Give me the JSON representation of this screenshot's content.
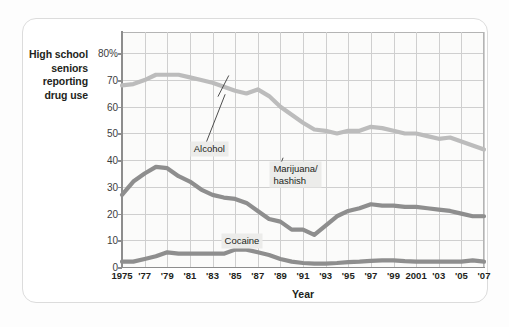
{
  "figure": {
    "y_axis_caption": "High school\nseniors\nreporting\ndrug use",
    "x_axis_title": "Year"
  },
  "annotations": [
    {
      "name": "alcohol",
      "text": "Alcohol",
      "x_pct": 19.0,
      "y_pct": 53.0
    },
    {
      "name": "marijuana",
      "text": "Marijuana/\nhashish",
      "x_pct": 41.0,
      "y_pct": 44.5
    },
    {
      "name": "cocaine",
      "text": "Cocaine",
      "x_pct": 27.5,
      "y_pct": 14.0
    }
  ],
  "chart_data": {
    "type": "line",
    "title": "",
    "subtitle": "",
    "xlabel": "Year",
    "ylabel": "High school seniors reporting drug use",
    "xlim": [
      1975,
      2007
    ],
    "ylim": [
      0,
      88
    ],
    "grid": true,
    "legend_position": "inline-annotations",
    "ytick_labels": [
      "0",
      "10",
      "20",
      "30",
      "40",
      "50",
      "60",
      "70",
      "80%"
    ],
    "ytick_values": [
      0,
      10,
      20,
      30,
      40,
      50,
      60,
      70,
      80
    ],
    "xtick_labels": [
      "1975",
      "'77",
      "'79",
      "'81",
      "'83",
      "'85",
      "'87",
      "'89",
      "'91",
      "'93",
      "'95",
      "'97",
      "'99",
      "2001",
      "'03",
      "'05",
      "'07"
    ],
    "xtick_values": [
      1975,
      1977,
      1979,
      1981,
      1983,
      1985,
      1987,
      1989,
      1991,
      1993,
      1995,
      1997,
      1999,
      2001,
      2003,
      2005,
      2007
    ],
    "x": [
      1975,
      1976,
      1977,
      1978,
      1979,
      1980,
      1981,
      1982,
      1983,
      1984,
      1985,
      1986,
      1987,
      1988,
      1989,
      1990,
      1991,
      1992,
      1993,
      1994,
      1995,
      1996,
      1997,
      1998,
      1999,
      2000,
      2001,
      2002,
      2003,
      2004,
      2005,
      2006,
      2007
    ],
    "series": [
      {
        "name": "Alcohol",
        "color": "#bcbcbc",
        "width": 4.2,
        "values": [
          68,
          68.5,
          70,
          72,
          72,
          72,
          71,
          70,
          69,
          67.5,
          66,
          65,
          66.5,
          64,
          60,
          57,
          54,
          51.5,
          51,
          50,
          51,
          51,
          52.5,
          52,
          51,
          50,
          50,
          49,
          48,
          48.5,
          47,
          45.5,
          44
        ]
      },
      {
        "name": "Marijuana/hashish",
        "color": "#8e8e8e",
        "width": 4.2,
        "values": [
          27,
          32,
          35,
          37.5,
          37,
          34,
          32,
          29,
          27,
          26,
          25.5,
          24,
          21,
          18,
          17,
          14,
          14,
          12,
          15.5,
          19,
          21,
          22,
          23.5,
          23,
          23,
          22.5,
          22.5,
          22,
          21.5,
          21,
          20,
          19,
          19
        ]
      },
      {
        "name": "Cocaine",
        "color": "#8e8e8e",
        "width": 4.2,
        "values": [
          2,
          2,
          3,
          4,
          5.5,
          5,
          5,
          5,
          5,
          5,
          6.5,
          6.5,
          5.5,
          4.5,
          3,
          2,
          1.5,
          1.3,
          1.3,
          1.5,
          1.8,
          2,
          2.3,
          2.5,
          2.5,
          2.2,
          2,
          2,
          2,
          2,
          2,
          2.5,
          2
        ]
      }
    ]
  }
}
